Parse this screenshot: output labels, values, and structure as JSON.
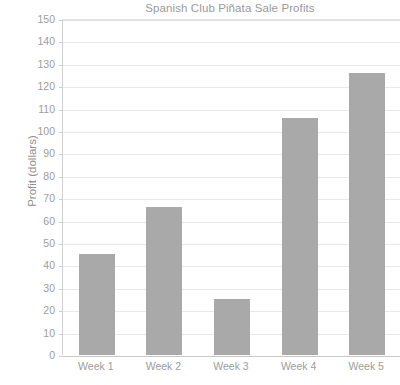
{
  "chart_data": {
    "type": "bar",
    "title": "Spanish Club Piñata Sale Profits",
    "xlabel": "",
    "ylabel": "Profit (dollars)",
    "categories": [
      "Week 1",
      "Week 2",
      "Week 3",
      "Week 4",
      "Week 5"
    ],
    "values": [
      45,
      66,
      25,
      106,
      126
    ],
    "ylim": [
      0,
      150
    ],
    "ytick_step": 10,
    "yticks": [
      0,
      10,
      20,
      30,
      40,
      50,
      60,
      70,
      80,
      90,
      100,
      110,
      120,
      130,
      140,
      150
    ],
    "ytick_labels": [
      "0",
      "10",
      "20",
      "30",
      "40",
      "50",
      "60",
      "70",
      "80",
      "90",
      "100",
      "110",
      "120",
      "130",
      "140",
      "150"
    ],
    "grid": true,
    "grid_axis": "y",
    "legend": false,
    "legend_position": "none",
    "bar_color": "#a9a9a9",
    "text_color": "#9d9d9d",
    "gridline_color": "#e8e8e8",
    "axis_color": "#cfcfcf",
    "background_color": "#ffffff"
  }
}
